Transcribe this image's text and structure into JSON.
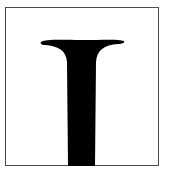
{
  "figure": {
    "icon": "flared-t-glyph",
    "fill_color": "#000000",
    "border_color": "#4a4a4a",
    "background_color": "#ffffff"
  }
}
